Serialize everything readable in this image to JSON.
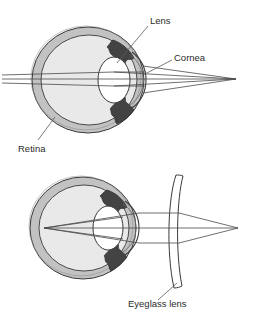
{
  "figure": {
    "title": "",
    "type": "eye-optics-diagram",
    "background_color": "#ffffff",
    "line_color": "#3a3a3a",
    "labels": {
      "lens": "Lens",
      "cornea": "Cornea",
      "retina": "Retina",
      "eyeglass_lens": "Eyeglass lens"
    },
    "colors": {
      "sclera_ring": "#c2c2c2",
      "interior": "#e9e9e9",
      "iris_dark": "#434343",
      "lens_fill": "#ffffff",
      "outline": "#3a3a3a",
      "ray": "#4a4a4a",
      "leader": "#5a5a5a",
      "text": "#2b2b2b"
    },
    "panels": [
      {
        "name": "uncorrected-eye",
        "caption": "",
        "eye_center": {
          "x": 88,
          "y": 80
        },
        "eye_radius_x": 56,
        "eye_radius_y": 53,
        "focal_point": {
          "x": 236,
          "y": 79
        },
        "has_eyeglass_lens": false,
        "labels_shown": [
          "Lens",
          "Cornea",
          "Retina"
        ]
      },
      {
        "name": "corrected-eye",
        "caption": "",
        "eye_center": {
          "x": 83,
          "y": 228
        },
        "eye_radius_x": 53,
        "eye_radius_y": 51,
        "focal_point": {
          "x": 238,
          "y": 228
        },
        "has_eyeglass_lens": true,
        "labels_shown": [
          "Eyeglass lens"
        ]
      }
    ]
  }
}
